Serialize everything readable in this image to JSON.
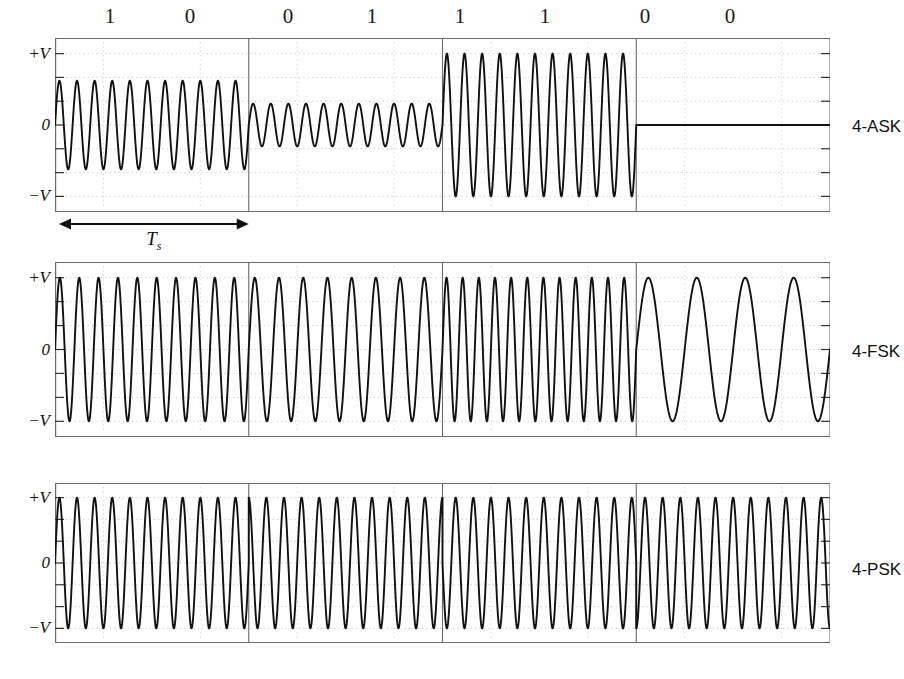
{
  "figure": {
    "background": "#ffffff",
    "trace_color": "#111111",
    "axis_color": "#6b6b6b",
    "grid_color": "#bdbdbd",
    "width": 904,
    "height": 679
  },
  "bit_sequence": {
    "bits": [
      "1",
      "0",
      "0",
      "1",
      "1",
      "1",
      "0",
      "0"
    ],
    "dibits": [
      "10",
      "01",
      "11",
      "00"
    ],
    "label_x": [
      110,
      190,
      288,
      372,
      460,
      545,
      645,
      730
    ]
  },
  "axis": {
    "y_ticks": [
      "+V",
      "0",
      "−V"
    ],
    "y_values": [
      1,
      0,
      -1
    ],
    "ylim": [
      -1.18,
      1.18
    ],
    "n_minor_ticks": 7,
    "symbol_boundaries_frac": [
      0.0,
      0.25,
      0.5,
      0.75,
      1.0
    ],
    "grid": "dotted"
  },
  "annotation": {
    "symbol_period_label": "T",
    "symbol_period_sub": "s",
    "arrow": "double-headed",
    "span_symbol_index": 0
  },
  "panels": [
    {
      "id": "ask",
      "label": "4-ASK",
      "modulation": "Amplitude Shift Keying",
      "x": 55,
      "y": 38,
      "width": 775,
      "height": 174,
      "label_y": 127,
      "segments": [
        {
          "dibit": "10",
          "amplitude": 0.62,
          "frequency_cycles": 11,
          "phase": 0
        },
        {
          "dibit": "01",
          "amplitude": 0.3,
          "frequency_cycles": 11,
          "phase": 0
        },
        {
          "dibit": "11",
          "amplitude": 1.0,
          "frequency_cycles": 11,
          "phase": 0
        },
        {
          "dibit": "00",
          "amplitude": 0.0,
          "frequency_cycles": 11,
          "phase": 0
        }
      ]
    },
    {
      "id": "fsk",
      "label": "4-FSK",
      "modulation": "Frequency Shift Keying",
      "x": 55,
      "y": 262,
      "width": 775,
      "height": 175,
      "label_y": 352,
      "segments": [
        {
          "dibit": "10",
          "amplitude": 1.0,
          "frequency_cycles": 10,
          "phase": 0
        },
        {
          "dibit": "01",
          "amplitude": 1.0,
          "frequency_cycles": 8,
          "phase": 0
        },
        {
          "dibit": "11",
          "amplitude": 1.0,
          "frequency_cycles": 12,
          "phase": 0
        },
        {
          "dibit": "00",
          "amplitude": 1.0,
          "frequency_cycles": 4,
          "phase": 0
        }
      ]
    },
    {
      "id": "psk",
      "label": "4-PSK",
      "modulation": "Phase Shift Keying",
      "x": 55,
      "y": 483,
      "width": 775,
      "height": 160,
      "label_y": 570,
      "segments": [
        {
          "dibit": "10",
          "amplitude": 1.0,
          "frequency_cycles": 11,
          "phase": 0
        },
        {
          "dibit": "01",
          "amplitude": 1.0,
          "frequency_cycles": 11,
          "phase": 1.5707963
        },
        {
          "dibit": "11",
          "amplitude": 1.0,
          "frequency_cycles": 11,
          "phase": 3.1415927
        },
        {
          "dibit": "00",
          "amplitude": 1.0,
          "frequency_cycles": 11,
          "phase": 4.712389
        }
      ]
    }
  ],
  "chart_data": {
    "type": "line",
    "xlabel": "",
    "ylabel": "",
    "ylim": [
      -1,
      1
    ],
    "ytick_labels": [
      "+V",
      "0",
      "−V"
    ],
    "grid": true,
    "legend": "right-side panel labels",
    "categories": [
      "10",
      "01",
      "11",
      "00"
    ],
    "series": [
      {
        "name": "4-ASK",
        "parameter": "amplitude",
        "values": [
          0.62,
          0.3,
          1.0,
          0.0
        ]
      },
      {
        "name": "4-FSK",
        "parameter": "cycles per symbol",
        "values": [
          10,
          8,
          12,
          4
        ]
      },
      {
        "name": "4-PSK",
        "parameter": "phase (degrees)",
        "values": [
          0,
          90,
          180,
          270
        ]
      }
    ]
  }
}
